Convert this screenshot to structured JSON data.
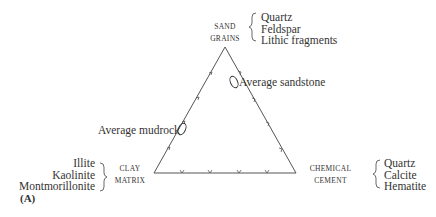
{
  "figure_label": "(A)",
  "vertices": {
    "top": {
      "label_line1": "SAND",
      "label_line2": "GRAINS",
      "components": [
        "Quartz",
        "Feldspar",
        "Lithic fragments"
      ]
    },
    "bottom_left": {
      "label_line1": "CLAY",
      "label_line2": "MATRIX",
      "components": [
        "Illite",
        "Kaolinite",
        "Montmorillonite"
      ]
    },
    "bottom_right": {
      "label_line1": "CHEMICAL",
      "label_line2": "CEMENT",
      "components": [
        "Quartz",
        "Calcite",
        "Hematite"
      ]
    }
  },
  "annotations": {
    "sandstone": "Average sandstone",
    "mudrock": "Average mudrock"
  }
}
